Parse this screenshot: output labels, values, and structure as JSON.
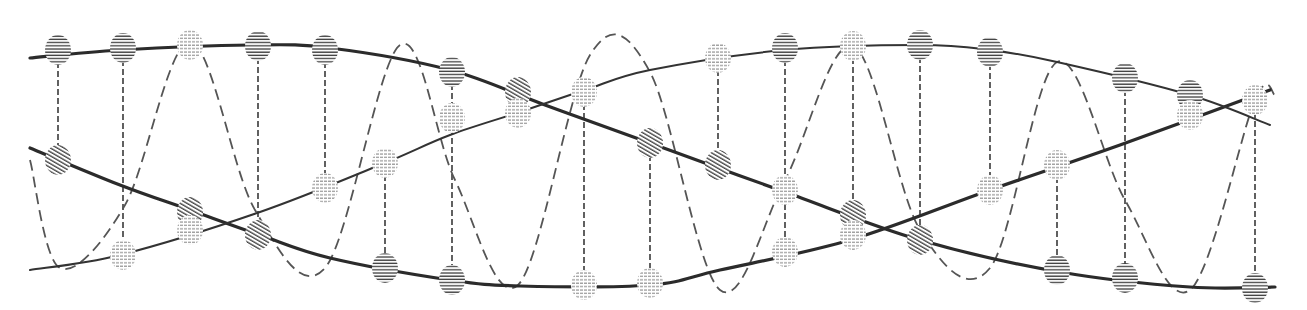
{
  "figure": {
    "title": "",
    "colors": {
      "background": "#ffffff",
      "strand": "#2b2b2b",
      "wave": "#555555",
      "rung": "#3a3a3a",
      "hatch_dark": "#3a3a3a",
      "hatch_light": "#8a8a8a"
    }
  },
  "strands": [
    {
      "name": "strand-upper-to-lower",
      "style": "thin-then-thick",
      "points": [
        [
          30,
          58
        ],
        [
          120,
          50
        ],
        [
          250,
          45
        ],
        [
          330,
          48
        ],
        [
          450,
          70
        ],
        [
          545,
          105
        ],
        [
          650,
          143
        ],
        [
          785,
          192
        ],
        [
          920,
          240
        ],
        [
          1060,
          272
        ],
        [
          1190,
          287
        ],
        [
          1275,
          287
        ]
      ]
    },
    {
      "name": "strand-middle-to-bottom-rise",
      "style": "thick",
      "points": [
        [
          30,
          148
        ],
        [
          120,
          185
        ],
        [
          190,
          210
        ],
        [
          260,
          235
        ],
        [
          330,
          258
        ],
        [
          450,
          280
        ],
        [
          520,
          286
        ],
        [
          650,
          285
        ],
        [
          720,
          270
        ],
        [
          850,
          240
        ],
        [
          990,
          190
        ],
        [
          1120,
          145
        ],
        [
          1270,
          90
        ]
      ]
    },
    {
      "name": "strand-bottom-to-top-arc",
      "style": "thin",
      "points": [
        [
          30,
          270
        ],
        [
          120,
          255
        ],
        [
          260,
          212
        ],
        [
          380,
          165
        ],
        [
          450,
          135
        ],
        [
          520,
          112
        ],
        [
          585,
          90
        ],
        [
          650,
          70
        ],
        [
          785,
          50
        ],
        [
          920,
          45
        ],
        [
          990,
          50
        ],
        [
          1057,
          62
        ],
        [
          1190,
          95
        ],
        [
          1270,
          125
        ]
      ]
    }
  ],
  "wave": {
    "name": "dashed-sine",
    "points": [
      [
        30,
        160
      ],
      [
        60,
        268
      ],
      [
        125,
        205
      ],
      [
        190,
        42
      ],
      [
        255,
        210
      ],
      [
        325,
        268
      ],
      [
        400,
        45
      ],
      [
        455,
        180
      ],
      [
        518,
        285
      ],
      [
        590,
        55
      ],
      [
        650,
        72
      ],
      [
        720,
        290
      ],
      [
        785,
        180
      ],
      [
        853,
        46
      ],
      [
        920,
        230
      ],
      [
        990,
        268
      ],
      [
        1057,
        62
      ],
      [
        1125,
        200
      ],
      [
        1190,
        290
      ],
      [
        1255,
        100
      ],
      [
        1275,
        95
      ]
    ]
  },
  "beads": [
    {
      "x": 58,
      "y": 50,
      "tone": "dark"
    },
    {
      "x": 123,
      "y": 48,
      "tone": "dark"
    },
    {
      "x": 190,
      "y": 45,
      "tone": "light"
    },
    {
      "x": 258,
      "y": 46,
      "tone": "dark"
    },
    {
      "x": 325,
      "y": 50,
      "tone": "dark"
    },
    {
      "x": 452,
      "y": 72,
      "tone": "dark"
    },
    {
      "x": 518,
      "y": 92,
      "tone": "diag"
    },
    {
      "x": 584,
      "y": 92,
      "tone": "light"
    },
    {
      "x": 718,
      "y": 58,
      "tone": "light"
    },
    {
      "x": 785,
      "y": 48,
      "tone": "dark"
    },
    {
      "x": 853,
      "y": 46,
      "tone": "light"
    },
    {
      "x": 920,
      "y": 45,
      "tone": "dark"
    },
    {
      "x": 990,
      "y": 52,
      "tone": "dark"
    },
    {
      "x": 1125,
      "y": 78,
      "tone": "dark"
    },
    {
      "x": 1190,
      "y": 95,
      "tone": "dark"
    },
    {
      "x": 1255,
      "y": 100,
      "tone": "light"
    },
    {
      "x": 58,
      "y": 160,
      "tone": "diag"
    },
    {
      "x": 190,
      "y": 212,
      "tone": "diag"
    },
    {
      "x": 258,
      "y": 235,
      "tone": "diag"
    },
    {
      "x": 385,
      "y": 163,
      "tone": "light"
    },
    {
      "x": 325,
      "y": 188,
      "tone": "light"
    },
    {
      "x": 190,
      "y": 230,
      "tone": "light"
    },
    {
      "x": 452,
      "y": 118,
      "tone": "light"
    },
    {
      "x": 518,
      "y": 113,
      "tone": "light"
    },
    {
      "x": 650,
      "y": 143,
      "tone": "diag"
    },
    {
      "x": 718,
      "y": 165,
      "tone": "diag"
    },
    {
      "x": 785,
      "y": 190,
      "tone": "light"
    },
    {
      "x": 853,
      "y": 215,
      "tone": "diag"
    },
    {
      "x": 853,
      "y": 235,
      "tone": "light"
    },
    {
      "x": 920,
      "y": 240,
      "tone": "diag"
    },
    {
      "x": 990,
      "y": 190,
      "tone": "light"
    },
    {
      "x": 1057,
      "y": 165,
      "tone": "light"
    },
    {
      "x": 1190,
      "y": 115,
      "tone": "light"
    },
    {
      "x": 123,
      "y": 255,
      "tone": "light"
    },
    {
      "x": 385,
      "y": 268,
      "tone": "dark"
    },
    {
      "x": 452,
      "y": 280,
      "tone": "dark"
    },
    {
      "x": 584,
      "y": 285,
      "tone": "light"
    },
    {
      "x": 650,
      "y": 283,
      "tone": "light"
    },
    {
      "x": 785,
      "y": 252,
      "tone": "light"
    },
    {
      "x": 1057,
      "y": 270,
      "tone": "dark"
    },
    {
      "x": 1125,
      "y": 278,
      "tone": "dark"
    },
    {
      "x": 1255,
      "y": 288,
      "tone": "dark"
    }
  ],
  "rungs": [
    [
      58,
      62,
      58,
      150
    ],
    [
      123,
      60,
      123,
      245
    ],
    [
      258,
      58,
      258,
      225
    ],
    [
      325,
      62,
      325,
      178
    ],
    [
      385,
      175,
      385,
      258
    ],
    [
      452,
      84,
      452,
      270
    ],
    [
      584,
      104,
      584,
      275
    ],
    [
      650,
      155,
      650,
      273
    ],
    [
      718,
      70,
      718,
      155
    ],
    [
      785,
      60,
      785,
      242
    ],
    [
      853,
      58,
      853,
      205
    ],
    [
      920,
      57,
      920,
      230
    ],
    [
      990,
      64,
      990,
      180
    ],
    [
      1057,
      177,
      1057,
      260
    ],
    [
      1125,
      90,
      1125,
      268
    ],
    [
      1190,
      107,
      1190,
      105
    ],
    [
      1255,
      112,
      1255,
      278
    ]
  ]
}
